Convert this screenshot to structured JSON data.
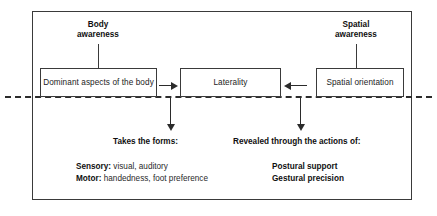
{
  "diagram": {
    "colors": {
      "frame": "#3a3a3a",
      "divider": "#2b2b2b",
      "text": "#1c1c1c",
      "heading": "#101010",
      "background": "#ffffff"
    },
    "captions": {
      "body_awareness": "Body\nawareness",
      "spatial_awareness": "Spatial\nawareness"
    },
    "nodes": {
      "dominant": "Dominant aspects of the body",
      "laterality": "Laterality",
      "spatial_orientation": "Spatial orientation"
    },
    "leads": {
      "left": "Takes the forms:",
      "right": "Revealed through the actions of:"
    },
    "details": {
      "left": [
        {
          "label": "Sensory:",
          "value": " visual, auditory"
        },
        {
          "label": "Motor:",
          "value": " handedness, foot preference"
        }
      ],
      "right": [
        "Postural support",
        "Gestural precision"
      ]
    }
  }
}
